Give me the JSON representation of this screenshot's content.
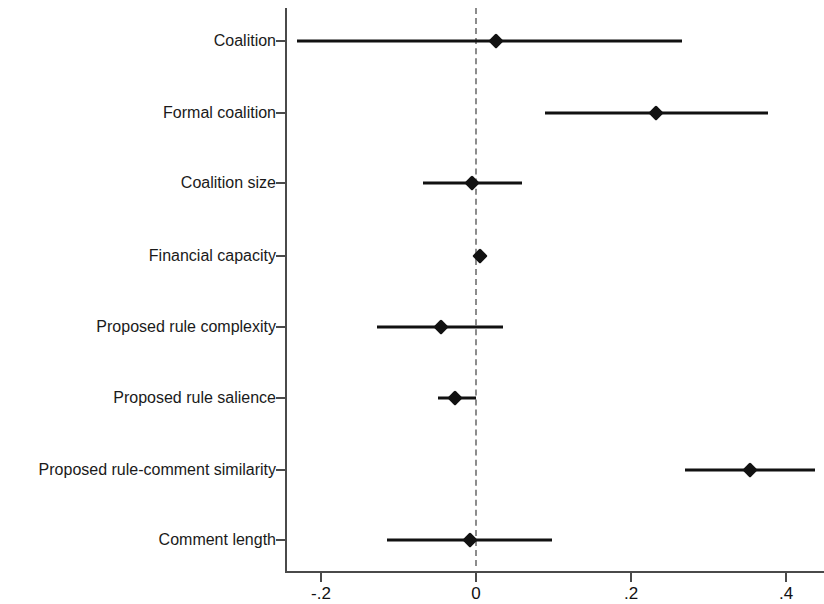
{
  "chart_data": {
    "type": "scatter",
    "title": "",
    "subtitle": "",
    "xlabel": "",
    "ylabel": "",
    "xlim": [
      -0.246,
      0.449
    ],
    "xticks": [
      -0.2,
      0,
      0.2,
      0.4
    ],
    "xticklabels": [
      "-.2",
      "0",
      ".2",
      ".4"
    ],
    "grid": false,
    "legend": null,
    "reference_line": 0,
    "reference_line_style": "dashed",
    "orientation": "horizontal",
    "categories": [
      "Coalition",
      "Formal coalition",
      "Coalition size",
      "Financial capacity",
      "Proposed rule complexity",
      "Proposed rule salience",
      "Proposed rule-comment similarity",
      "Comment length"
    ],
    "values": [
      0.026,
      0.232,
      -0.005,
      0.005,
      -0.045,
      -0.027,
      0.354,
      -0.008
    ],
    "ci_low": [
      -0.231,
      0.089,
      -0.068,
      -0.001,
      -0.128,
      -0.049,
      0.27,
      -0.115
    ],
    "ci_high": [
      0.266,
      0.377,
      0.059,
      0.01,
      0.035,
      0.0,
      0.437,
      0.098
    ],
    "series": [
      {
        "name": "Coefficient estimate",
        "points": [
          {
            "label": "Coalition",
            "estimate": 0.026,
            "ci_low": -0.231,
            "ci_high": 0.266
          },
          {
            "label": "Formal coalition",
            "estimate": 0.232,
            "ci_low": 0.089,
            "ci_high": 0.377
          },
          {
            "label": "Coalition size",
            "estimate": -0.005,
            "ci_low": -0.068,
            "ci_high": 0.059
          },
          {
            "label": "Financial capacity",
            "estimate": 0.005,
            "ci_low": -0.001,
            "ci_high": 0.01
          },
          {
            "label": "Proposed rule complexity",
            "estimate": -0.045,
            "ci_low": -0.128,
            "ci_high": 0.035
          },
          {
            "label": "Proposed rule salience",
            "estimate": -0.027,
            "ci_low": -0.049,
            "ci_high": 0.0
          },
          {
            "label": "Proposed rule-comment similarity",
            "estimate": 0.354,
            "ci_low": 0.27,
            "ci_high": 0.437
          },
          {
            "label": "Comment length",
            "estimate": -0.008,
            "ci_low": -0.115,
            "ci_high": 0.098
          }
        ]
      }
    ],
    "colors": {
      "marker": "#111111",
      "ci_line": "#111111",
      "axis": "#4a4a4a",
      "reference_line": "#8c8c8c",
      "background": "#ffffff",
      "text": "#1a1a1a"
    }
  },
  "geometry": {
    "x_zero_px": 476,
    "px_per_unit": 775,
    "row_y_px": [
      41,
      113,
      183,
      256,
      327,
      398,
      470,
      540
    ]
  }
}
